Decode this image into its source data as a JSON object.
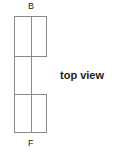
{
  "diagram": {
    "back_label": "B",
    "front_label": "F",
    "caption": "top view",
    "stroke_color": "#8a8a8a"
  }
}
